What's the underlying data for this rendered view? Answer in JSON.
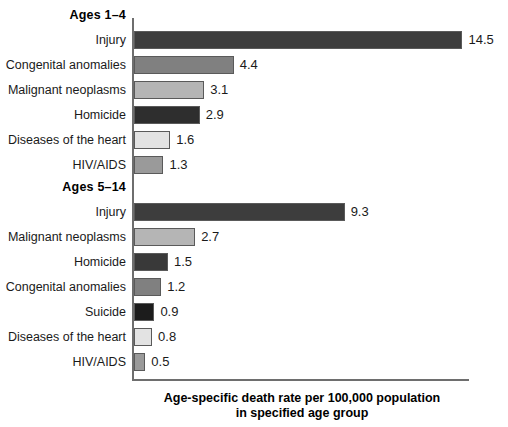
{
  "chart_data": {
    "type": "bar",
    "orientation": "horizontal",
    "title": "",
    "xlabel": "Age-specific death rate per 100,000 population in specified age group",
    "ylabel": "",
    "xlim": [
      0,
      14.5
    ],
    "grid": false,
    "legend": "none",
    "value_label_precision": 1,
    "groups": [
      {
        "name": "Ages 1–4",
        "categories": [
          "Injury",
          "Congenital anomalies",
          "Malignant neoplasms",
          "Homicide",
          "Diseases of the heart",
          "HIV/AIDS"
        ],
        "values": [
          14.5,
          4.4,
          3.1,
          2.9,
          1.6,
          1.3
        ],
        "colors": [
          "#3d3d3d",
          "#808080",
          "#b5b5b5",
          "#2e2e2e",
          "#e3e3e3",
          "#9a9a9a"
        ]
      },
      {
        "name": "Ages 5–14",
        "categories": [
          "Injury",
          "Malignant neoplasms",
          "Homicide",
          "Congenital anomalies",
          "Suicide",
          "Diseases of the heart",
          "HIV/AIDS"
        ],
        "values": [
          9.3,
          2.7,
          1.5,
          1.2,
          0.9,
          0.8,
          0.5
        ],
        "colors": [
          "#3d3d3d",
          "#b5b5b5",
          "#393939",
          "#808080",
          "#1c1c1c",
          "#e3e3e3",
          "#9a9a9a"
        ]
      }
    ]
  },
  "axis": {
    "title_line_1": "Age-specific death rate per 100,000 population",
    "title_line_2": "in specified age group"
  },
  "style": {
    "axis_color": "#6e6e6e",
    "bar_outline": "#5a5a5a",
    "text_color": "#1a1a1a",
    "background": "#ffffff"
  }
}
